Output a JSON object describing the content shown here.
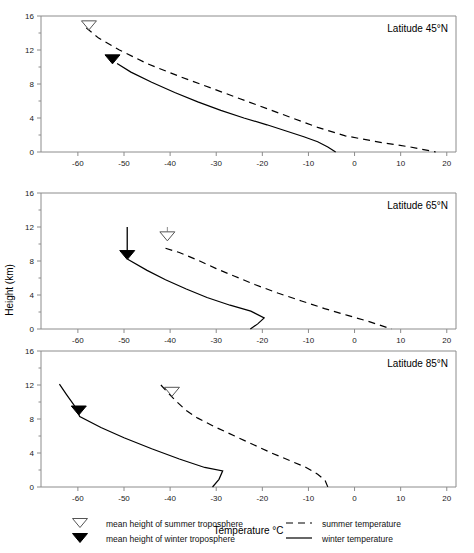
{
  "figure": {
    "xlabel": "Temperature °C",
    "ylabel": "Height (km)"
  },
  "chart_data": {
    "type": "line",
    "title": "",
    "xlabel": "Temperature °C",
    "ylabel": "Height (km)",
    "xlim": [
      -68,
      22
    ],
    "ylim": [
      0,
      16
    ],
    "xticks": [
      -60,
      -50,
      -40,
      -30,
      -20,
      -10,
      0,
      10,
      20
    ],
    "yticks": [
      0,
      4,
      8,
      12,
      16
    ],
    "grid": false,
    "legend_position": "bottom",
    "legend": [
      {
        "key": "mean-height-summer",
        "label": "mean height of summer troposphere",
        "marker": "open-triangle-down"
      },
      {
        "key": "mean-height-winter",
        "label": "mean height of winter troposphere",
        "marker": "filled-triangle-down"
      },
      {
        "key": "summer-temperature",
        "label": "summer temperature",
        "style": "dashed"
      },
      {
        "key": "winter-temperature",
        "label": "winter temperature",
        "style": "solid"
      }
    ],
    "panels": [
      {
        "id": "lat45",
        "title": "Latitude 45°N",
        "series": [
          {
            "name": "summer temperature",
            "style": "dashed",
            "points": [
              [
                -58.2,
                14.6
              ],
              [
                -55.5,
                13.4
              ],
              [
                -51.0,
                12.0
              ],
              [
                -45.0,
                10.4
              ],
              [
                -38.0,
                8.9
              ],
              [
                -31.0,
                7.5
              ],
              [
                -25.0,
                6.3
              ],
              [
                -19.0,
                5.1
              ],
              [
                -13.5,
                4.0
              ],
              [
                -8.0,
                2.9
              ],
              [
                -2.0,
                1.9
              ],
              [
                6.0,
                1.1
              ],
              [
                12.0,
                0.6
              ],
              [
                17.6,
                0.0
              ]
            ]
          },
          {
            "name": "winter temperature",
            "style": "solid",
            "points": [
              [
                -51.5,
                10.4
              ],
              [
                -48.5,
                9.4
              ],
              [
                -44.0,
                8.2
              ],
              [
                -39.0,
                7.0
              ],
              [
                -34.0,
                5.9
              ],
              [
                -29.0,
                4.9
              ],
              [
                -24.0,
                4.0
              ],
              [
                -19.0,
                3.2
              ],
              [
                -15.0,
                2.5
              ],
              [
                -11.0,
                1.8
              ],
              [
                -8.0,
                1.2
              ],
              [
                -5.8,
                0.6
              ],
              [
                -4.1,
                0.0
              ]
            ]
          }
        ],
        "markers": [
          {
            "name": "mean-height-summer",
            "type": "open-triangle-down",
            "x": -57.6,
            "y": 14.9,
            "arrow": false
          },
          {
            "name": "mean-height-winter",
            "type": "filled-triangle-down",
            "x": -52.5,
            "y": 10.9,
            "arrow": false
          }
        ]
      },
      {
        "id": "lat65",
        "title": "Latitude 65°N",
        "series": [
          {
            "name": "summer temperature",
            "style": "dashed",
            "points": [
              [
                -41.0,
                9.5
              ],
              [
                -38.0,
                9.0
              ],
              [
                -34.0,
                8.1
              ],
              [
                -30.0,
                7.1
              ],
              [
                -26.0,
                6.2
              ],
              [
                -21.5,
                5.2
              ],
              [
                -16.5,
                4.2
              ],
              [
                -11.5,
                3.3
              ],
              [
                -6.5,
                2.4
              ],
              [
                -1.5,
                1.6
              ],
              [
                3.0,
                0.9
              ],
              [
                8.0,
                0.0
              ]
            ]
          },
          {
            "name": "winter temperature",
            "style": "solid",
            "points": [
              [
                -49.2,
                8.2
              ],
              [
                -45.0,
                6.9
              ],
              [
                -41.0,
                5.8
              ],
              [
                -36.5,
                4.7
              ],
              [
                -32.0,
                3.7
              ],
              [
                -27.0,
                2.8
              ],
              [
                -22.5,
                2.1
              ],
              [
                -19.6,
                1.3
              ],
              [
                -21.0,
                0.6
              ],
              [
                -22.6,
                0.0
              ]
            ]
          }
        ],
        "markers": [
          {
            "name": "mean-height-summer",
            "type": "open-triangle-down",
            "x": -40.6,
            "y": 10.9,
            "arrow": true,
            "arrow_top": 12.0
          },
          {
            "name": "mean-height-winter",
            "type": "filled-triangle-down",
            "x": -49.3,
            "y": 8.7,
            "arrow": true,
            "arrow_top": 12.0
          }
        ]
      },
      {
        "id": "lat85",
        "title": "Latitude 85°N",
        "series": [
          {
            "name": "summer temperature",
            "style": "dashed",
            "points": [
              [
                -42.0,
                12.0
              ],
              [
                -40.5,
                11.1
              ],
              [
                -38.5,
                10.0
              ],
              [
                -36.5,
                9.0
              ],
              [
                -34.0,
                8.1
              ],
              [
                -30.0,
                7.0
              ],
              [
                -26.0,
                6.0
              ],
              [
                -22.0,
                5.0
              ],
              [
                -18.0,
                4.0
              ],
              [
                -14.0,
                3.1
              ],
              [
                -10.5,
                2.3
              ],
              [
                -8.0,
                1.5
              ],
              [
                -6.4,
                0.8
              ],
              [
                -5.8,
                0.0
              ]
            ]
          },
          {
            "name": "winter temperature",
            "style": "solid",
            "points": [
              [
                -64.0,
                12.1
              ],
              [
                -62.5,
                10.9
              ],
              [
                -60.8,
                9.6
              ],
              [
                -59.6,
                8.3
              ],
              [
                -55.0,
                7.0
              ],
              [
                -50.0,
                5.8
              ],
              [
                -44.0,
                4.5
              ],
              [
                -38.0,
                3.3
              ],
              [
                -32.5,
                2.3
              ],
              [
                -28.6,
                1.9
              ],
              [
                -29.4,
                0.9
              ],
              [
                -30.8,
                0.0
              ]
            ]
          }
        ],
        "markers": [
          {
            "name": "mean-height-summer",
            "type": "open-triangle-down",
            "x": -39.6,
            "y": 11.2,
            "arrow": false
          },
          {
            "name": "mean-height-winter",
            "type": "filled-triangle-down",
            "x": -59.8,
            "y": 9.0,
            "arrow": false
          }
        ]
      }
    ]
  }
}
